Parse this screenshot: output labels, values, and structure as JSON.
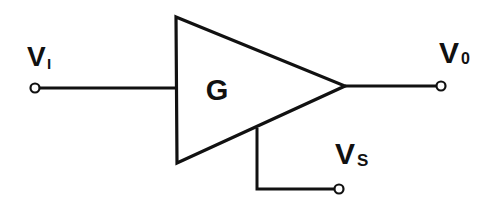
{
  "diagram": {
    "type": "amplifier-block",
    "block": {
      "label": "G",
      "shape": "triangle"
    },
    "input": {
      "symbol": "V",
      "subscript": "I",
      "description": "input voltage terminal"
    },
    "output": {
      "symbol": "V",
      "subscript": "0",
      "description": "output voltage terminal"
    },
    "supply": {
      "symbol": "V",
      "subscript": "S",
      "description": "supply voltage terminal"
    },
    "colors": {
      "stroke": "#111111",
      "background": "#ffffff"
    }
  }
}
